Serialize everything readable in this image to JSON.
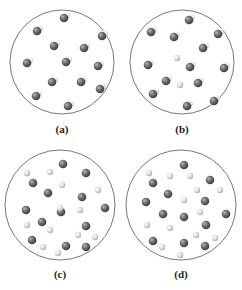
{
  "panels": [
    {
      "label": "(a)",
      "cx": 62,
      "cy": 62,
      "r": 52,
      "description": "Pure compound: identical diatomic molecules",
      "molecules": [
        [
          64,
          18
        ],
        [
          37,
          31
        ],
        [
          102,
          36
        ],
        [
          54,
          46
        ],
        [
          84,
          48
        ],
        [
          27,
          63
        ],
        [
          66,
          62
        ],
        [
          98,
          66
        ],
        [
          52,
          82
        ],
        [
          81,
          82
        ],
        [
          100,
          89
        ],
        [
          36,
          96
        ],
        [
          68,
          106
        ]
      ],
      "light_atoms": []
    },
    {
      "label": "(b)",
      "cx": 182,
      "cy": 62,
      "r": 52,
      "description": "Mixture of diatomic molecules and single light atoms",
      "molecules": [
        [
          189,
          20
        ],
        [
          151,
          32
        ],
        [
          218,
          34
        ],
        [
          174,
          37
        ],
        [
          203,
          48
        ],
        [
          148,
          65
        ],
        [
          224,
          68
        ],
        [
          190,
          67
        ],
        [
          166,
          81
        ],
        [
          198,
          83
        ],
        [
          153,
          94
        ],
        [
          214,
          101
        ],
        [
          187,
          106
        ]
      ],
      "light_atoms": [
        [
          177,
          58
        ],
        [
          180,
          85
        ]
      ]
    },
    {
      "label": "(c)",
      "cx": 60,
      "cy": 205,
      "r": 55,
      "description": "Mixture of dark atoms and light atoms",
      "dark_atoms": [
        [
          63,
          164
        ],
        [
          86,
          173
        ],
        [
          33,
          183
        ],
        [
          48,
          193
        ],
        [
          82,
          197
        ],
        [
          26,
          210
        ],
        [
          61,
          212
        ],
        [
          105,
          208
        ],
        [
          42,
          222
        ],
        [
          86,
          226
        ],
        [
          32,
          240
        ],
        [
          66,
          246
        ],
        [
          86,
          247
        ]
      ],
      "light_atoms": [
        [
          27,
          173
        ],
        [
          50,
          172
        ],
        [
          62,
          185
        ],
        [
          98,
          190
        ],
        [
          60,
          208
        ],
        [
          80,
          210
        ],
        [
          27,
          225
        ],
        [
          50,
          230
        ],
        [
          78,
          235
        ],
        [
          95,
          237
        ],
        [
          43,
          247
        ],
        [
          58,
          253
        ]
      ]
    },
    {
      "label": "(d)",
      "cx": 181,
      "cy": 205,
      "r": 55,
      "description": "Mixture of dark atoms and light atoms (more dark)",
      "dark_atoms": [
        [
          184,
          165
        ],
        [
          153,
          183
        ],
        [
          210,
          180
        ],
        [
          146,
          202
        ],
        [
          168,
          194
        ],
        [
          205,
          201
        ],
        [
          163,
          214
        ],
        [
          184,
          217
        ],
        [
          226,
          214
        ],
        [
          206,
          225
        ],
        [
          153,
          241
        ],
        [
          184,
          243
        ],
        [
          205,
          246
        ]
      ],
      "light_atoms": [
        [
          149,
          173
        ],
        [
          170,
          176
        ],
        [
          190,
          176
        ],
        [
          197,
          190
        ],
        [
          220,
          190
        ],
        [
          184,
          200
        ],
        [
          200,
          212
        ],
        [
          147,
          225
        ],
        [
          170,
          228
        ],
        [
          196,
          235
        ],
        [
          215,
          238
        ],
        [
          162,
          247
        ],
        [
          180,
          255
        ]
      ]
    }
  ],
  "colors": {
    "circle_stroke": "#555555",
    "dark_atom": "#6a6a6a",
    "dark_atom_highlight": "#a8a8a8",
    "light_atom": "#d4d4d4",
    "light_atom_highlight": "#f4f4f4",
    "mol_light_part": "#e6e6e6"
  }
}
